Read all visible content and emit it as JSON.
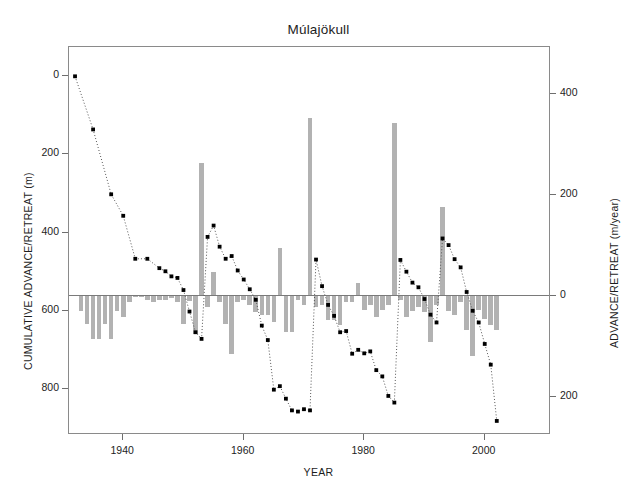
{
  "chart_data": {
    "type": "bar",
    "title": "Múlajökull",
    "xlabel": "YEAR",
    "ylabel": "CUMULATIVE ADVANCE/RETREAT (m)",
    "y2label": "ADVANCE/RETREAT (m/year)",
    "xlim": [
      1931,
      2011
    ],
    "ylim": [
      -75,
      918
    ],
    "y2lim": [
      -275,
      492
    ],
    "grid": false,
    "legend": null,
    "xticks": [
      1940,
      1960,
      1980,
      2000
    ],
    "xtick_labels": [
      "1940",
      "1960",
      "1980",
      "2000"
    ],
    "yticks": [
      0,
      200,
      400,
      600,
      800
    ],
    "ytick_labels": [
      "0",
      "200",
      "400",
      "600",
      "800"
    ],
    "y2ticks": [
      400,
      200,
      0,
      -200
    ],
    "y2tick_labels": [
      "400",
      "200",
      "0",
      "200"
    ],
    "bar_color": "#b2b2b2",
    "line_color": "#555555",
    "marker_color": "#000000",
    "series": [
      {
        "name": "ADVANCE/RETREAT (m/year)",
        "type": "bar",
        "axis": "right",
        "x": [
          1933,
          1934,
          1935,
          1936,
          1937,
          1938,
          1939,
          1940,
          1941,
          1942,
          1943,
          1944,
          1945,
          1946,
          1947,
          1948,
          1949,
          1950,
          1951,
          1952,
          1953,
          1954,
          1955,
          1956,
          1957,
          1958,
          1959,
          1960,
          1961,
          1962,
          1963,
          1964,
          1965,
          1966,
          1967,
          1968,
          1969,
          1970,
          1971,
          1972,
          1973,
          1974,
          1975,
          1976,
          1977,
          1978,
          1979,
          1980,
          1981,
          1982,
          1983,
          1984,
          1985,
          1986,
          1987,
          1988,
          1989,
          1990,
          1991,
          1992,
          1993,
          1994,
          1995,
          1996,
          1997,
          1998,
          1999,
          2000,
          2001,
          2002
        ],
        "values": [
          -30,
          -55,
          -85,
          -85,
          -55,
          -85,
          -30,
          -42,
          -12,
          0,
          0,
          -8,
          -12,
          -8,
          -8,
          -4,
          -12,
          -55,
          -10,
          -75,
          262,
          -22,
          48,
          -12,
          -55,
          -115,
          -12,
          -8,
          -18,
          -32,
          -38,
          -38,
          -52,
          95,
          -72,
          -72,
          -8,
          -18,
          352,
          -22,
          -18,
          -48,
          -48,
          -58,
          -12,
          -12,
          25,
          -28,
          -18,
          -42,
          -28,
          -18,
          342,
          -8,
          -42,
          -30,
          -22,
          -32,
          -92,
          -18,
          175,
          -30,
          -38,
          -12,
          -68,
          -118,
          -28,
          -45,
          -58,
          -68
        ]
      },
      {
        "name": "CUMULATIVE ADVANCE/RETREAT (m)",
        "type": "line",
        "axis": "left",
        "style": "dotted",
        "x": [
          1932,
          1935,
          1938,
          1940,
          1942,
          1944,
          1946,
          1947,
          1948,
          1949,
          1950,
          1951,
          1952,
          1953,
          1954,
          1955,
          1956,
          1957,
          1958,
          1959,
          1960,
          1961,
          1962,
          1963,
          1964,
          1965,
          1966,
          1967,
          1968,
          1969,
          1970,
          1971,
          1972,
          1973,
          1974,
          1975,
          1976,
          1977,
          1978,
          1979,
          1980,
          1981,
          1982,
          1983,
          1984,
          1985,
          1986,
          1987,
          1988,
          1989,
          1990,
          1991,
          1992,
          1993,
          1994,
          1995,
          1996,
          1997,
          1998,
          1999,
          2000,
          2001,
          2002
        ],
        "values": [
          0,
          136,
          302,
          357,
          467,
          467,
          491,
          499,
          512,
          516,
          547,
          602,
          655,
          672,
          411,
          382,
          436,
          467,
          460,
          497,
          520,
          545,
          572,
          638,
          675,
          802,
          793,
          825,
          855,
          858,
          852,
          855,
          469,
          537,
          585,
          613,
          655,
          652,
          710,
          700,
          709,
          704,
          752,
          768,
          818,
          835,
          470,
          500,
          528,
          540,
          570,
          610,
          630,
          415,
          432,
          468,
          489,
          552,
          600,
          630,
          685,
          738,
          882
        ]
      }
    ]
  }
}
